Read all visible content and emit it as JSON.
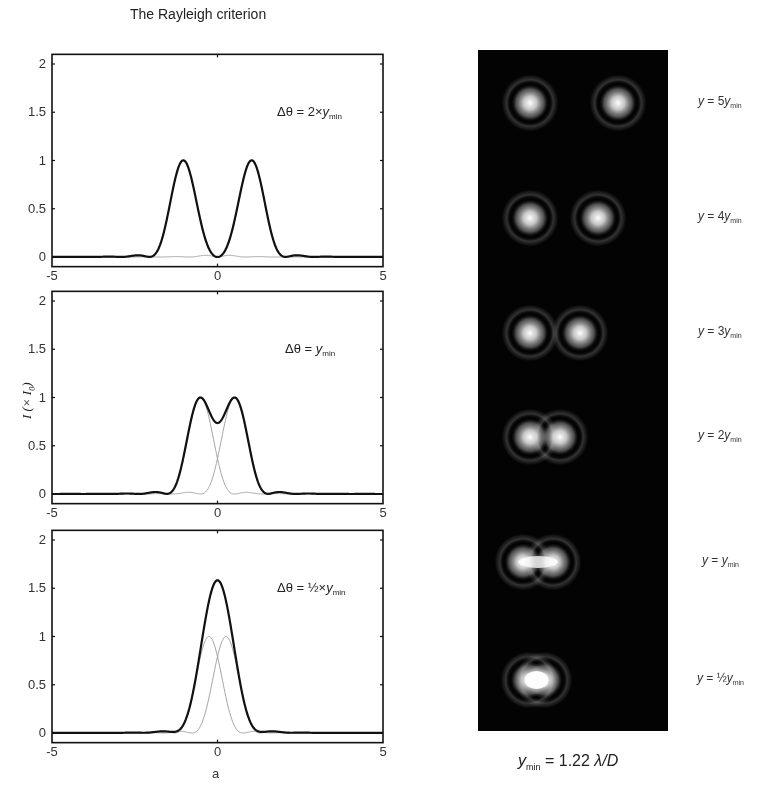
{
  "figure": {
    "left_title": "The Rayleigh criterion",
    "ylabel_main": "I (× I",
    "ylabel_sub": "0",
    "ylabel_close": ")",
    "xlabel": "a",
    "caption": {
      "var": "y",
      "sub": "min",
      "rest": " = 1.22 ",
      "formula": "λ/D"
    }
  },
  "chart_data": [
    {
      "type": "line",
      "title": "The Rayleigh criterion",
      "annotation": {
        "prefix": "Δθ = 2×",
        "var": "y",
        "sub": "min"
      },
      "xlabel": "",
      "ylabel": "",
      "xlim": [
        -5,
        5
      ],
      "ylim": [
        -0.1,
        2.1
      ],
      "xticks": [
        "-5",
        "0",
        "5"
      ],
      "yticks": [
        "0",
        "0.5",
        "1",
        "1.5",
        "2"
      ],
      "separation": 2.06,
      "series": [
        {
          "name": "Sum intensity",
          "style": "thick-black",
          "peak_positions": [
            -1.03,
            1.03
          ],
          "peak_values": [
            1.0,
            1.0
          ],
          "min_at_0": 0.0
        },
        {
          "name": "Left Airy component",
          "style": "thin-gray",
          "center": -1.03,
          "peak": 1.0
        },
        {
          "name": "Right Airy component",
          "style": "thin-gray",
          "center": 1.03,
          "peak": 1.0
        }
      ]
    },
    {
      "type": "line",
      "annotation": {
        "prefix": "Δθ = ",
        "var": "y",
        "sub": "min"
      },
      "xlabel": "",
      "ylabel": "I (× I0)",
      "xlim": [
        -5,
        5
      ],
      "ylim": [
        -0.1,
        2.1
      ],
      "xticks": [
        "-5",
        "0",
        "5"
      ],
      "yticks": [
        "0",
        "0.5",
        "1",
        "1.5",
        "2"
      ],
      "separation": 1.03,
      "series": [
        {
          "name": "Sum intensity",
          "style": "thick-black",
          "peak_positions": [
            -0.52,
            0.52
          ],
          "peak_values": [
            1.0,
            1.0
          ],
          "min_at_0": 0.73
        },
        {
          "name": "Left Airy component",
          "style": "thin-gray",
          "center": -0.515,
          "peak": 1.0
        },
        {
          "name": "Right Airy component",
          "style": "thin-gray",
          "center": 0.515,
          "peak": 1.0
        }
      ]
    },
    {
      "type": "line",
      "annotation": {
        "prefix": "Δθ = ½×",
        "var": "y",
        "sub": "min"
      },
      "xlabel": "a",
      "ylabel": "",
      "xlim": [
        -5,
        5
      ],
      "ylim": [
        -0.1,
        2.1
      ],
      "xticks": [
        "-5",
        "0",
        "5"
      ],
      "yticks": [
        "0",
        "0.5",
        "1",
        "1.5",
        "2"
      ],
      "separation": 0.515,
      "series": [
        {
          "name": "Sum intensity",
          "style": "thick-black",
          "peak_positions": [
            0.0
          ],
          "peak_values": [
            1.57
          ]
        },
        {
          "name": "Left Airy component",
          "style": "thin-gray",
          "center": -0.2575,
          "peak": 1.0
        },
        {
          "name": "Right Airy component",
          "style": "thin-gray",
          "center": 0.2575,
          "peak": 1.0
        }
      ]
    }
  ],
  "airy_panel": {
    "background": "#030303",
    "rows": [
      {
        "label_prefix": "y = 5",
        "var": "y",
        "sub": "min",
        "centers": [
          [
            530,
            103
          ],
          [
            618,
            103
          ]
        ],
        "merged": false
      },
      {
        "label_prefix": "y = 4",
        "var": "y",
        "sub": "min",
        "centers": [
          [
            530,
            218
          ],
          [
            598,
            218
          ]
        ],
        "merged": false
      },
      {
        "label_prefix": "y = 3",
        "var": "y",
        "sub": "min",
        "centers": [
          [
            530,
            333
          ],
          [
            580,
            333
          ]
        ],
        "merged": false
      },
      {
        "label_prefix": "y = 2",
        "var": "y",
        "sub": "min",
        "centers": [
          [
            530,
            437
          ],
          [
            560,
            437
          ]
        ],
        "merged": false
      },
      {
        "label_prefix": "y = ",
        "var": "y",
        "sub": "min",
        "centers": [
          [
            523,
            562
          ],
          [
            553,
            562
          ]
        ],
        "merged": true
      },
      {
        "label_prefix": "y = ½",
        "var": "y",
        "sub": "min",
        "centers": [
          [
            529,
            680
          ],
          [
            544,
            680
          ]
        ],
        "merged": true
      }
    ]
  },
  "colors": {
    "sum_curve": "#111111",
    "component_curve": "#9a9a9a",
    "axis": "#111111",
    "panel": "#030303"
  }
}
